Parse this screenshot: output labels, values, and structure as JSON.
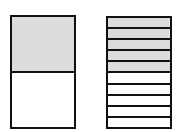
{
  "diagram": {
    "title": "",
    "shade_color": "#dcdcdc",
    "line_color": "#111111",
    "models": [
      {
        "name": "halves",
        "parts": 2,
        "shaded": 1,
        "fraction": "1/2"
      },
      {
        "name": "tenths",
        "parts": 10,
        "shaded": 5,
        "fraction": "5/10"
      }
    ]
  }
}
